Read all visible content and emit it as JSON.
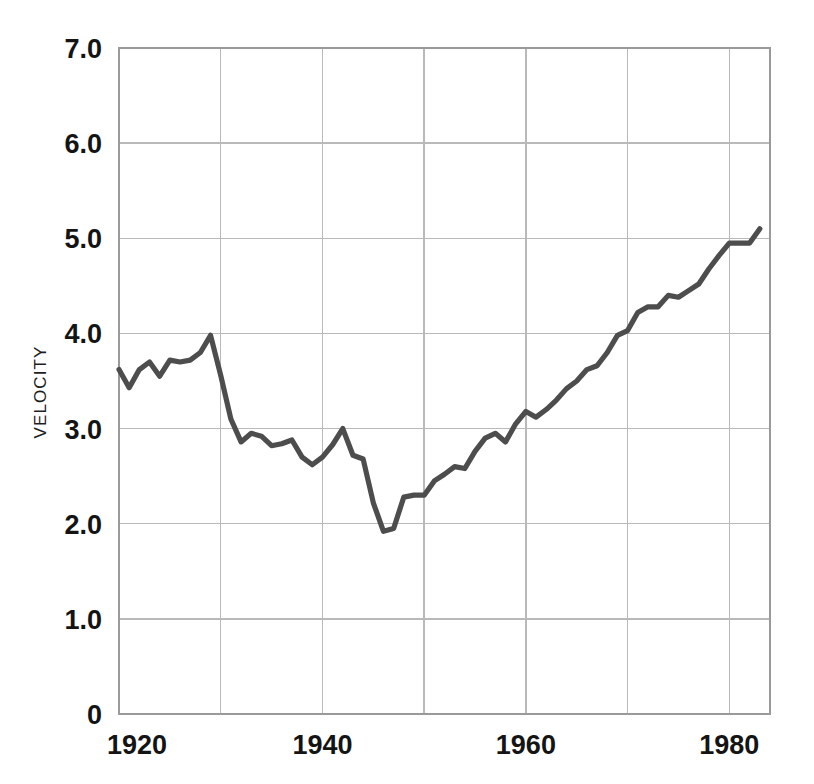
{
  "chart_data": {
    "type": "line",
    "title": "",
    "xlabel": "",
    "ylabel": "VELOCITY",
    "xlim": [
      1920,
      1984
    ],
    "ylim": [
      0,
      7
    ],
    "grid": true,
    "legend": false,
    "x_ticks": [
      "1920",
      "1940",
      "1960",
      "1980"
    ],
    "x_tick_values": [
      1920,
      1940,
      1960,
      1980
    ],
    "x_gridline_values": [
      1930,
      1940,
      1950,
      1960,
      1970,
      1980
    ],
    "y_ticks": [
      "0",
      "1.0",
      "2.0",
      "3.0",
      "4.0",
      "5.0",
      "6.0",
      "7.0"
    ],
    "y_tick_values": [
      0,
      1,
      2,
      3,
      4,
      5,
      6,
      7
    ],
    "series": [
      {
        "name": "Velocity",
        "color": "#4d4d4d",
        "x": [
          1920,
          1921,
          1922,
          1923,
          1924,
          1925,
          1926,
          1927,
          1928,
          1929,
          1930,
          1931,
          1932,
          1933,
          1934,
          1935,
          1936,
          1937,
          1938,
          1939,
          1940,
          1941,
          1942,
          1943,
          1944,
          1945,
          1946,
          1947,
          1948,
          1949,
          1950,
          1951,
          1952,
          1953,
          1954,
          1955,
          1956,
          1957,
          1958,
          1959,
          1960,
          1961,
          1962,
          1963,
          1964,
          1965,
          1966,
          1967,
          1968,
          1969,
          1970,
          1971,
          1972,
          1973,
          1974,
          1975,
          1976,
          1977,
          1978,
          1979,
          1980,
          1981,
          1982,
          1983
        ],
        "values": [
          3.62,
          3.43,
          3.62,
          3.7,
          3.55,
          3.72,
          3.7,
          3.72,
          3.8,
          3.98,
          3.56,
          3.1,
          2.86,
          2.95,
          2.92,
          2.82,
          2.84,
          2.88,
          2.7,
          2.62,
          2.7,
          2.83,
          3.0,
          2.72,
          2.68,
          2.22,
          1.92,
          1.95,
          2.28,
          2.3,
          2.3,
          2.45,
          2.52,
          2.6,
          2.58,
          2.76,
          2.9,
          2.95,
          2.86,
          3.05,
          3.18,
          3.12,
          3.2,
          3.3,
          3.42,
          3.5,
          3.62,
          3.66,
          3.8,
          3.98,
          4.03,
          4.22,
          4.28,
          4.28,
          4.4,
          4.38,
          4.45,
          4.52,
          4.68,
          4.82,
          4.95,
          4.95,
          4.95,
          5.1
        ]
      }
    ]
  }
}
